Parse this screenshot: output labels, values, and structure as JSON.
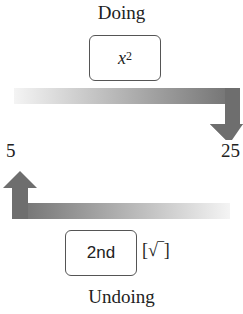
{
  "diagram": {
    "top_label": "Doing",
    "top_key": {
      "base": "x",
      "exponent": "2"
    },
    "left_value": "5",
    "right_value": "25",
    "bottom_key": "2nd",
    "bottom_secondary": "[√‾]",
    "bottom_label": "Undoing",
    "colors": {
      "arrow_dark": "#6e6e6e",
      "arrow_light": "#f2f2f2",
      "key_border": "#555555"
    }
  }
}
